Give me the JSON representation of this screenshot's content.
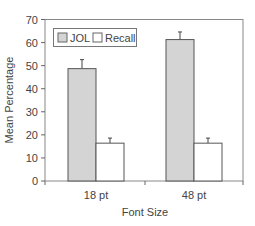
{
  "chart_data": {
    "type": "bar",
    "title": "",
    "xlabel": "Font Size",
    "ylabel": "Mean Percentage",
    "categories": [
      "18 pt",
      "48 pt"
    ],
    "series": [
      {
        "name": "JOL",
        "color": "#d4d4d4",
        "values": [
          48.7,
          61.3
        ],
        "error_upper": [
          52.6,
          64.6
        ]
      },
      {
        "name": "Recall",
        "color": "#ffffff",
        "values": [
          16.4,
          16.4
        ],
        "error_upper": [
          18.6,
          18.6
        ]
      }
    ],
    "ylim": [
      0,
      70
    ],
    "yticks": [
      0,
      10,
      20,
      30,
      40,
      50,
      60,
      70
    ],
    "grid": false,
    "legend_position": "top-left inside"
  },
  "legend": {
    "jol": "JOL",
    "recall": "Recall"
  },
  "axes": {
    "x_title": "Font Size",
    "y_title": "Mean Percentage",
    "x_labels": [
      "18 pt",
      "48 pt"
    ],
    "y_labels": [
      "0",
      "10",
      "20",
      "30",
      "40",
      "50",
      "60",
      "70"
    ]
  }
}
